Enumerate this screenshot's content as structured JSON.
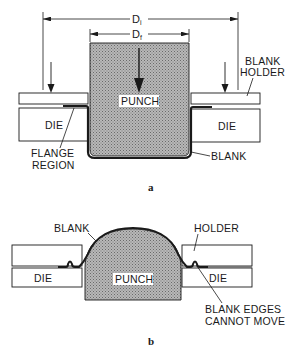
{
  "figure_a": {
    "caption": "a",
    "dimensions": {
      "outer": {
        "symbol": "D",
        "subscript": "i"
      },
      "inner": {
        "symbol": "D",
        "subscript": "f"
      }
    },
    "labels": {
      "punch": "PUNCH",
      "die_left": "DIE",
      "die_right": "DIE",
      "blank_holder_line1": "BLANK",
      "blank_holder_line2": "HOLDER",
      "flange_line1": "FLANGE",
      "flange_line2": "REGION",
      "blank": "BLANK"
    }
  },
  "figure_b": {
    "caption": "b",
    "labels": {
      "blank": "BLANK",
      "holder": "HOLDER",
      "punch": "PUNCH",
      "die_left": "DIE",
      "die_right": "DIE",
      "edges_line1": "BLANK EDGES",
      "edges_line2": "CANNOT MOVE"
    }
  },
  "colors": {
    "ink": "#1a1a1a",
    "punch_fill": "#a9a9a9",
    "background": "#ffffff"
  }
}
